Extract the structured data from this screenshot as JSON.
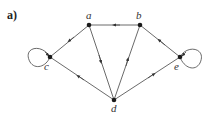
{
  "panel_label": "a)",
  "colors": {
    "edge": "#444444",
    "node": "#1a1a1a",
    "text": "#333333",
    "background": "#ffffff"
  },
  "nodes": [
    {
      "id": "a",
      "label": "a",
      "x": 89,
      "y": 25
    },
    {
      "id": "b",
      "label": "b",
      "x": 140,
      "y": 25
    },
    {
      "id": "c",
      "label": "c",
      "x": 50,
      "y": 57
    },
    {
      "id": "d",
      "label": "d",
      "x": 114,
      "y": 100
    },
    {
      "id": "e",
      "label": "e",
      "x": 180,
      "y": 57
    }
  ],
  "edges": [
    {
      "from": "b",
      "to": "a"
    },
    {
      "from": "a",
      "to": "c"
    },
    {
      "from": "a",
      "to": "d"
    },
    {
      "from": "d",
      "to": "b"
    },
    {
      "from": "e",
      "to": "b"
    },
    {
      "from": "d",
      "to": "c"
    },
    {
      "from": "d",
      "to": "e"
    },
    {
      "from": "c",
      "to": "c",
      "type": "self-loop"
    },
    {
      "from": "e",
      "to": "e",
      "type": "self-loop"
    }
  ]
}
